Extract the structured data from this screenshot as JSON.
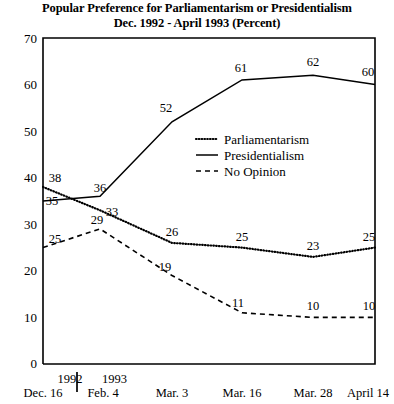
{
  "chart_data": {
    "type": "line",
    "title": "Popular Preference for Parliamentarism or Presidentialism",
    "subtitle": "Dec. 1992 - April 1993 (Percent)",
    "xlabel": "",
    "ylabel": "",
    "ylim": [
      0,
      70
    ],
    "yticks": [
      0,
      10,
      20,
      30,
      40,
      50,
      60,
      70
    ],
    "grid": false,
    "legend_position": "center-right",
    "categories": [
      "Dec. 16",
      "Feb. 4",
      "Mar. 3",
      "Mar. 16",
      "Mar. 28",
      "April 14"
    ],
    "year_groups": [
      {
        "year": "1992",
        "categories": [
          "Dec. 16"
        ]
      },
      {
        "year": "1993",
        "categories": [
          "Feb. 4",
          "Mar. 3",
          "Mar. 16",
          "Mar. 28",
          "April 14"
        ]
      }
    ],
    "series": [
      {
        "name": "Parliamentarism",
        "style": "dotted",
        "values": [
          38,
          33,
          26,
          25,
          23,
          25
        ]
      },
      {
        "name": "Presidentialism",
        "style": "solid",
        "values": [
          35,
          36,
          52,
          61,
          62,
          60
        ]
      },
      {
        "name": "No Opinion",
        "style": "dashed",
        "values": [
          25,
          29,
          19,
          11,
          10,
          10
        ]
      }
    ]
  },
  "legend": {
    "items": [
      {
        "label": "Parliamentarism",
        "style": "dotted"
      },
      {
        "label": "Presidentialism",
        "style": "solid"
      },
      {
        "label": "No Opinion",
        "style": "dashed"
      }
    ]
  },
  "axis": {
    "ytick_labels": [
      "70",
      "60",
      "50",
      "40",
      "30",
      "20",
      "10",
      "0"
    ],
    "xtick_labels": [
      "Dec. 16",
      "Feb. 4",
      "Mar. 3",
      "Mar. 16",
      "Mar. 28",
      "April 14"
    ],
    "year_labels": [
      "1992",
      "1993"
    ]
  },
  "data_labels": {
    "parliamentarism": [
      "38",
      "33",
      "26",
      "25",
      "23",
      "25"
    ],
    "presidentialism": [
      "35",
      "36",
      "52",
      "61",
      "62",
      "60"
    ],
    "no_opinion": [
      "25",
      "29",
      "19",
      "11",
      "10",
      "10"
    ]
  },
  "colors": {
    "ink": "#000000",
    "background": "#ffffff"
  }
}
